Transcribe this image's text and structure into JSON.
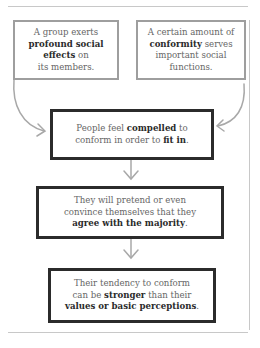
{
  "diagram": {
    "top_boxes": [
      {
        "lines": [
          {
            "parts": [
              {
                "text": "A group exerts",
                "bold": false
              }
            ]
          },
          {
            "parts": [
              {
                "text": "profound social",
                "bold": true
              }
            ]
          },
          {
            "parts": [
              {
                "text": "effects",
                "bold": true
              },
              {
                "text": " on",
                "bold": false
              }
            ]
          },
          {
            "parts": [
              {
                "text": "its members.",
                "bold": false
              }
            ]
          }
        ]
      },
      {
        "lines": [
          {
            "parts": [
              {
                "text": "A certain amount of",
                "bold": false
              }
            ]
          },
          {
            "parts": [
              {
                "text": "conformity",
                "bold": true
              },
              {
                "text": " serves",
                "bold": false
              }
            ]
          },
          {
            "parts": [
              {
                "text": "important social",
                "bold": false
              }
            ]
          },
          {
            "parts": [
              {
                "text": "functions.",
                "bold": false
              }
            ]
          }
        ]
      }
    ],
    "flow_boxes": [
      {
        "lines": [
          {
            "parts": [
              {
                "text": "People feel ",
                "bold": false
              },
              {
                "text": "compelled",
                "bold": true
              },
              {
                "text": " to",
                "bold": false
              }
            ]
          },
          {
            "parts": [
              {
                "text": "conform in order to ",
                "bold": false
              },
              {
                "text": "fit in",
                "bold": true
              },
              {
                "text": ".",
                "bold": false
              }
            ]
          }
        ]
      },
      {
        "lines": [
          {
            "parts": [
              {
                "text": "They will pretend or even",
                "bold": false
              }
            ]
          },
          {
            "parts": [
              {
                "text": "convince themselves that they",
                "bold": false
              }
            ]
          },
          {
            "parts": [
              {
                "text": "agree with the majority",
                "bold": true
              },
              {
                "text": ".",
                "bold": false
              }
            ]
          }
        ]
      },
      {
        "lines": [
          {
            "parts": [
              {
                "text": "Their tendency to conform",
                "bold": false
              }
            ]
          },
          {
            "parts": [
              {
                "text": "can be ",
                "bold": false
              },
              {
                "text": "stronger",
                "bold": true
              },
              {
                "text": " than their",
                "bold": false
              }
            ]
          },
          {
            "parts": [
              {
                "text": "values or basic perceptions",
                "bold": true
              },
              {
                "text": ".",
                "bold": false
              }
            ]
          }
        ]
      }
    ],
    "colors": {
      "grey_border": "#9e9e9e",
      "dark_border": "#2b2b2b",
      "arrow": "#a8a8a8",
      "rule": "#c8c8c8"
    }
  }
}
